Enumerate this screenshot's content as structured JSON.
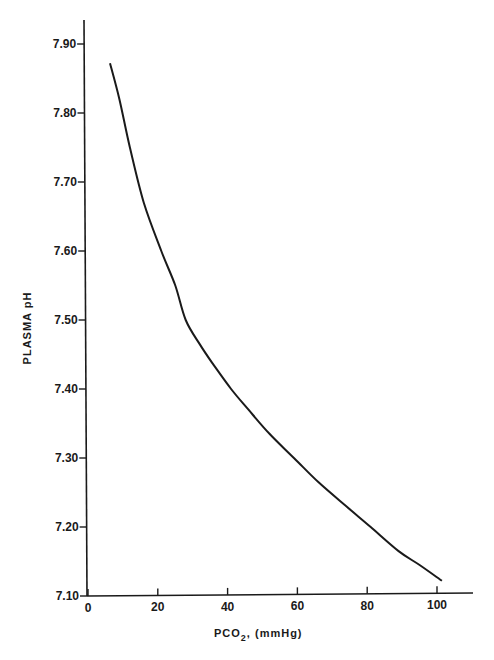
{
  "chart_data": {
    "type": "line",
    "title": "",
    "xlabel": "PCO2, (mmHg)",
    "xlabel_main": "PCO",
    "xlabel_sub": "2",
    "xlabel_rest": ", (mmHg)",
    "ylabel": "PLASMA pH",
    "xlim": [
      0,
      110
    ],
    "ylim": [
      7.1,
      7.93
    ],
    "grid": false,
    "legend": null,
    "x_ticks": [
      0,
      20,
      40,
      60,
      80,
      100
    ],
    "x_tick_labels": [
      "0",
      "20",
      "40",
      "60",
      "80",
      "100"
    ],
    "y_ticks": [
      7.1,
      7.2,
      7.3,
      7.4,
      7.5,
      7.6,
      7.7,
      7.8,
      7.9
    ],
    "y_tick_labels": [
      "7.10",
      "7.20",
      "7.30",
      "7.40",
      "7.50",
      "7.60",
      "7.70",
      "7.80",
      "7.90"
    ],
    "series": [
      {
        "name": "Plasma pH vs PCO2",
        "color": "#1a1a1a",
        "x": [
          6.3,
          9,
          12,
          16,
          21,
          25,
          28,
          32,
          36,
          41,
          46,
          52,
          59,
          66,
          74,
          81,
          89,
          95,
          101.4
        ],
        "y": [
          7.872,
          7.82,
          7.75,
          7.67,
          7.6,
          7.55,
          7.5,
          7.465,
          7.435,
          7.4,
          7.37,
          7.335,
          7.3,
          7.265,
          7.23,
          7.2,
          7.165,
          7.145,
          7.122
        ]
      }
    ]
  }
}
